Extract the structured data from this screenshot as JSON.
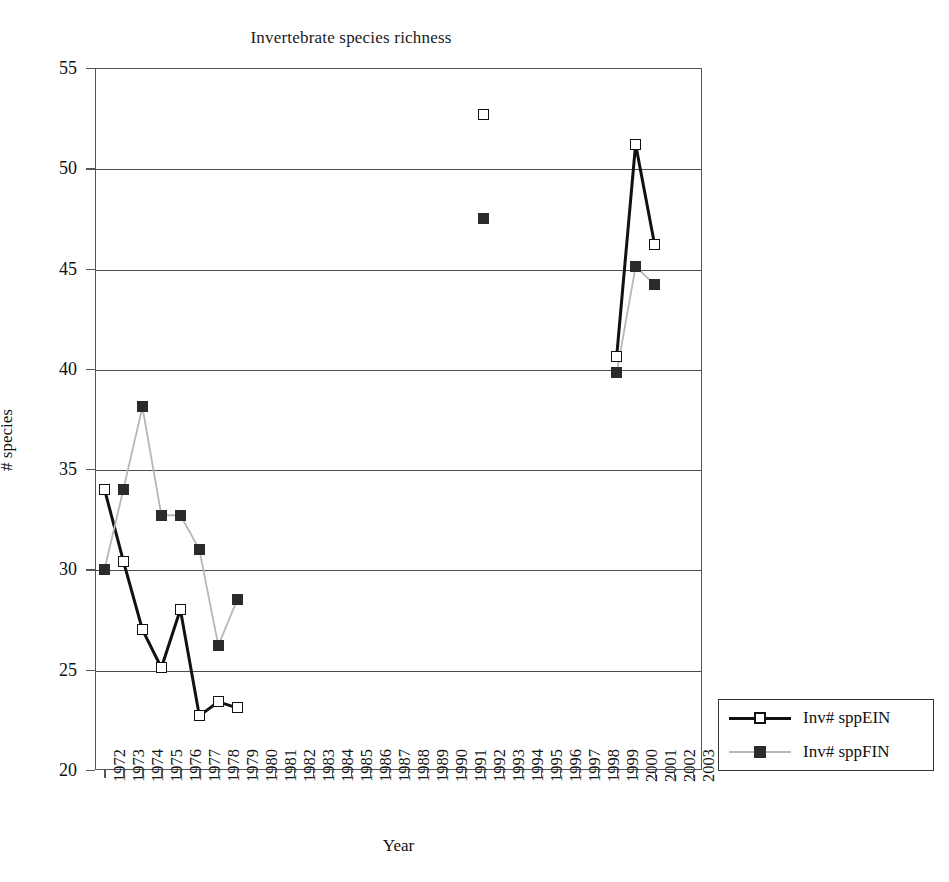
{
  "chart_data": {
    "type": "line",
    "title": "Invertebrate species richness",
    "xlabel": "Year",
    "ylabel": "# species",
    "ylim": [
      20,
      55
    ],
    "ytick_step": 5,
    "yticks": [
      20,
      25,
      30,
      35,
      40,
      45,
      50,
      55
    ],
    "grid": true,
    "legend_position": "right-outside",
    "categories": [
      "1972",
      "1973",
      "1974",
      "1975",
      "1976",
      "1977",
      "1978",
      "1979",
      "1980",
      "1981",
      "1982",
      "1983",
      "1984",
      "1985",
      "1986",
      "1987",
      "1988",
      "1989",
      "1990",
      "1991",
      "1992",
      "1993",
      "1994",
      "1995",
      "1996",
      "1997",
      "1998",
      "1999",
      "2000",
      "2001",
      "2002",
      "2003"
    ],
    "series": [
      {
        "name": "Inv# sppEIN",
        "color": "#111111",
        "marker": "open-square",
        "values": [
          34.0,
          30.4,
          27.0,
          25.1,
          28.0,
          22.7,
          23.4,
          23.1,
          null,
          null,
          null,
          null,
          null,
          null,
          null,
          null,
          null,
          null,
          null,
          null,
          52.7,
          null,
          null,
          null,
          null,
          null,
          null,
          40.6,
          51.2,
          46.2,
          null,
          null
        ]
      },
      {
        "name": "Inv# sppFIN",
        "color": "#2b2b2b",
        "line_color": "#b7b7b7",
        "marker": "filled-square",
        "values": [
          30.0,
          34.0,
          38.1,
          32.7,
          32.7,
          31.0,
          26.2,
          28.5,
          null,
          null,
          null,
          null,
          null,
          null,
          null,
          null,
          null,
          null,
          null,
          null,
          47.5,
          null,
          null,
          null,
          null,
          null,
          null,
          39.8,
          45.1,
          44.2,
          null,
          null
        ]
      }
    ]
  },
  "legend": {
    "entries": [
      {
        "label": "Inv# sppEIN"
      },
      {
        "label": "Inv# sppFIN"
      }
    ]
  }
}
